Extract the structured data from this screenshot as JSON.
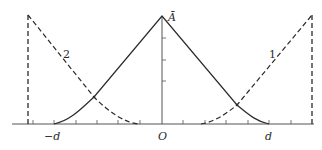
{
  "diagram": {
    "type": "curve-plot",
    "colors": {
      "stroke": "#2a2a2a",
      "axis": "#555555",
      "background": "#ffffff"
    },
    "labels": {
      "peak": "Ā",
      "origin": "O",
      "neg_d": "−d",
      "pos_d": "d",
      "curve1": "1",
      "curve2": "2"
    },
    "curves": [
      {
        "id": "central",
        "style": "solid",
        "description": "triangular peak of height Ā at O, reaching zero at ±d with rounded feet"
      },
      {
        "id": "curve1",
        "style": "dashed",
        "label": "1",
        "description": "rises from near O (right side) to the right boundary"
      },
      {
        "id": "curve2",
        "style": "dashed",
        "label": "2",
        "description": "mirror of curve 1, falling from left boundary toward O"
      }
    ],
    "boundaries": [
      {
        "side": "left",
        "style": "dashed"
      },
      {
        "side": "right",
        "style": "dashed"
      }
    ]
  }
}
